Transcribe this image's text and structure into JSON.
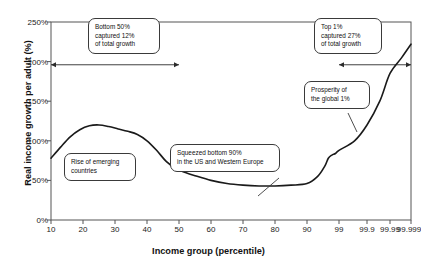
{
  "chart_data": {
    "type": "line",
    "title": "",
    "subtitle": "",
    "xlabel": "Income group (percentile)",
    "ylabel": "Real income growth per adult (%)",
    "x_tick_labels": [
      "10",
      "20",
      "30",
      "40",
      "50",
      "60",
      "70",
      "80",
      "90",
      "99",
      "99.9",
      "99.99",
      "99.999"
    ],
    "y_tick_labels": [
      "0%",
      "50%",
      "100%",
      "150%",
      "200%",
      "250%"
    ],
    "y_tick_values": [
      0,
      50,
      100,
      150,
      200,
      250
    ],
    "ylim": [
      0,
      250
    ],
    "grid": false,
    "legend": "none",
    "series": [
      {
        "name": "Real income growth per adult",
        "x": [
          10,
          13,
          16,
          19,
          22,
          25,
          28,
          31,
          34,
          37,
          40,
          43,
          46,
          49,
          52,
          55,
          60,
          65,
          70,
          75,
          80,
          85,
          90,
          93,
          95,
          96,
          97,
          98,
          99,
          99.5,
          99.9,
          99.95,
          99.99,
          99.995,
          99.999
        ],
        "values": [
          78,
          92,
          105,
          114,
          119,
          120,
          118,
          115,
          112,
          108,
          100,
          88,
          74,
          65,
          60,
          56,
          50,
          46,
          44,
          43,
          43,
          44,
          46,
          55,
          68,
          78,
          82,
          84,
          88,
          100,
          120,
          150,
          185,
          205,
          222
        ]
      }
    ],
    "annotations": [
      {
        "name": "bottom-50-note",
        "text": "Bottom 50%\ncaptured 12%\nof total growth"
      },
      {
        "name": "top-1-note",
        "text": "Top 1%\ncaptured 27%\nof total growth"
      },
      {
        "name": "rise-of-emerging-note",
        "text": "Rise of emerging\ncountries"
      },
      {
        "name": "squeezed-bottom-90-note",
        "text": "Squeezed bottom 90%\nin the US and Western Europe"
      },
      {
        "name": "prosperity-note",
        "text": "Prosperity of\nthe global 1%"
      }
    ],
    "arrows": [
      {
        "name": "bottom-50-span-arrow",
        "from_percentile": 10,
        "to_percentile": 50,
        "at_value": 196
      },
      {
        "name": "top-1-span-arrow",
        "from_percentile": 99,
        "to_percentile": 99.999,
        "at_value": 196
      }
    ],
    "colors": {
      "line": "#1a1a1a",
      "axis": "#555555",
      "text": "#222222",
      "background": "#ffffff",
      "annotation_border": "#3a3a3a"
    }
  }
}
